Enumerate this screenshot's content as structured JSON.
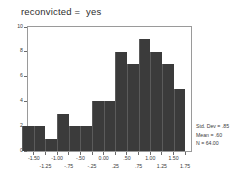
{
  "chart_data": {
    "type": "bar",
    "title": "reconvicted =  yes",
    "xlabel": "",
    "ylabel": "",
    "ylim": [
      0,
      10
    ],
    "xlim": [
      -1.625,
      1.875
    ],
    "grid": false,
    "legend": null,
    "bin_width": 0.25,
    "categories": [
      "-1.625",
      "-1.375",
      "-1.125",
      "-0.875",
      "-0.625",
      "-0.375",
      "-0.125",
      "0.125",
      "0.375",
      "0.625",
      "0.875",
      "1.125",
      "1.375",
      "1.625"
    ],
    "bin_centers": [
      -1.625,
      -1.375,
      -1.125,
      -0.875,
      -0.625,
      -0.375,
      -0.125,
      0.125,
      0.375,
      0.625,
      0.875,
      1.125,
      1.375,
      1.625
    ],
    "values": [
      2,
      2,
      1,
      3,
      2,
      2,
      4,
      4,
      8,
      7,
      9,
      8,
      7,
      5
    ],
    "y_ticks": [
      "0",
      "2",
      "4",
      "6",
      "8",
      "10"
    ],
    "y_tick_values": [
      0,
      2,
      4,
      6,
      8,
      10
    ],
    "x_ticks_upper": [
      "-1.50",
      "-1.00",
      "-.50",
      "0.00",
      ".50",
      "1.00",
      "1.50"
    ],
    "x_ticks_upper_values": [
      -1.5,
      -1.0,
      -0.5,
      0.0,
      0.5,
      1.0,
      1.5
    ],
    "x_ticks_lower": [
      "-1.25",
      "-.75",
      "-.25",
      ".25",
      ".75",
      "1.25",
      "1.75"
    ],
    "x_ticks_lower_values": [
      -1.25,
      -0.75,
      -0.25,
      0.25,
      0.75,
      1.25,
      1.75
    ],
    "bar_color": "#3b3b3b",
    "frame_color": "#9a9a9a",
    "background": "#ffffff"
  },
  "stats": {
    "std_dev": "Std. Dev = .85",
    "mean": "Mean = .60",
    "n": "N = 64.00"
  }
}
